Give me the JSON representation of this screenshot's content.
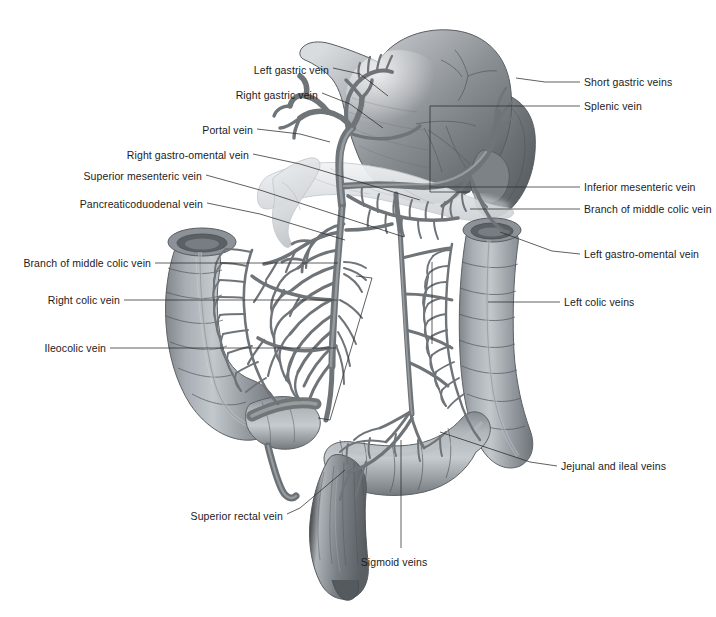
{
  "figure": {
    "background_color": "#ffffff",
    "ink_color": "#1b1b1b",
    "width": 716,
    "height": 617
  },
  "labels_left": [
    {
      "text": "Left gastric vein",
      "text_x": 329,
      "text_y": 70,
      "line": [
        [
          333,
          68
        ],
        [
          360,
          74
        ],
        [
          388,
          96
        ]
      ]
    },
    {
      "text": "Right gastric vein",
      "text_x": 318,
      "text_y": 95,
      "line": [
        [
          322,
          93
        ],
        [
          350,
          104
        ],
        [
          383,
          128
        ]
      ]
    },
    {
      "text": "Portal vein",
      "text_x": 253,
      "text_y": 130,
      "line": [
        [
          257,
          129
        ],
        [
          300,
          134
        ],
        [
          330,
          142
        ]
      ]
    },
    {
      "text": "Right  gastro-omental vein",
      "text_x": 249,
      "text_y": 155,
      "line": [
        [
          253,
          154
        ],
        [
          300,
          164
        ],
        [
          420,
          200
        ]
      ]
    },
    {
      "text": "Superior mesenteric vein",
      "text_x": 202,
      "text_y": 176,
      "line": [
        [
          206,
          175
        ],
        [
          260,
          190
        ],
        [
          404,
          237
        ]
      ]
    },
    {
      "text": "Pancreaticoduodenal vein",
      "text_x": 203,
      "text_y": 204,
      "line": [
        [
          207,
          203
        ],
        [
          260,
          214
        ],
        [
          345,
          240
        ]
      ]
    },
    {
      "text": "Branch of middle colic vein",
      "text_x": 151,
      "text_y": 263,
      "line": [
        [
          155,
          263
        ],
        [
          300,
          263
        ],
        [
          338,
          263
        ]
      ]
    },
    {
      "text": "Right  colic vein",
      "text_x": 120,
      "text_y": 300,
      "line": [
        [
          124,
          300
        ],
        [
          280,
          300
        ],
        [
          337,
          300
        ]
      ]
    },
    {
      "text": "Ileocolic vein",
      "text_x": 106,
      "text_y": 348,
      "line": [
        [
          110,
          348
        ],
        [
          280,
          348
        ],
        [
          336,
          348
        ]
      ]
    },
    {
      "text": "Superior rectal vein",
      "text_x": 283,
      "text_y": 516,
      "line": [
        [
          287,
          514
        ],
        [
          300,
          508
        ],
        [
          345,
          470
        ]
      ]
    }
  ],
  "labels_right": [
    {
      "text": "Short gastric veins",
      "text_x": 584,
      "text_y": 82,
      "line": [
        [
          580,
          82
        ],
        [
          545,
          82
        ],
        [
          516,
          78
        ]
      ]
    },
    {
      "text": "Splenic vein",
      "text_x": 584,
      "text_y": 106,
      "line": [
        [
          580,
          106
        ],
        [
          545,
          106
        ],
        [
          430,
          106
        ]
      ]
    },
    {
      "text": "Inferior mesenteric vein",
      "text_x": 584,
      "text_y": 187,
      "line": [
        [
          580,
          187
        ],
        [
          545,
          187
        ],
        [
          430,
          187
        ]
      ]
    },
    {
      "text": "Branch of middle colic vein",
      "text_x": 584,
      "text_y": 209,
      "line": [
        [
          580,
          209
        ],
        [
          545,
          209
        ],
        [
          470,
          209
        ]
      ]
    },
    {
      "text": "Left gastro-omental vein",
      "text_x": 584,
      "text_y": 254,
      "line": [
        [
          580,
          254
        ],
        [
          552,
          251
        ],
        [
          500,
          232
        ]
      ]
    },
    {
      "text": "Left  colic veins",
      "text_x": 564,
      "text_y": 302,
      "line": [
        [
          560,
          302
        ],
        [
          530,
          302
        ],
        [
          488,
          302
        ]
      ]
    },
    {
      "text": "Jejunal and ileal veins",
      "text_x": 561,
      "text_y": 466,
      "line": [
        [
          557,
          466
        ],
        [
          530,
          462
        ],
        [
          440,
          432
        ]
      ]
    }
  ],
  "labels_bottom": [
    {
      "text": "Sigmoid veins",
      "text_x": 394,
      "text_y": 556,
      "line": [
        [
          401,
          548
        ],
        [
          401,
          500
        ],
        [
          401,
          440
        ]
      ]
    }
  ],
  "organs": [
    {
      "name": "stomach",
      "label": "Stomach"
    },
    {
      "name": "spleen",
      "label": "Spleen"
    },
    {
      "name": "pancreas",
      "label": "Pancreas"
    },
    {
      "name": "duodenum",
      "label": "Duodenum"
    },
    {
      "name": "ascending-colon",
      "label": "Ascending colon"
    },
    {
      "name": "descending-colon",
      "label": "Descending colon"
    },
    {
      "name": "sigmoid-colon",
      "label": "Sigmoid colon"
    },
    {
      "name": "rectum",
      "label": "Rectum"
    },
    {
      "name": "cecum",
      "label": "Cecum"
    },
    {
      "name": "appendix",
      "label": "Appendix"
    }
  ],
  "palette": {
    "vessel_stroke": "#6f7276",
    "vessel_fill": "#9b9fa4",
    "vessel_highlight": "#c4c8cc",
    "organ_dark": "#6a6e73",
    "organ_mid": "#9096 9b",
    "organ_light": "#c8ccd0",
    "pancreas": "#dfe2e4",
    "leader_line": "#2b2b2b"
  }
}
